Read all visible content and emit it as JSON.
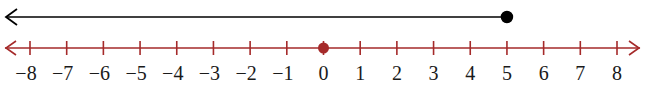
{
  "diagram": {
    "type": "number-line",
    "axis": {
      "min": -8,
      "max": 8,
      "step": 1,
      "tick_labels": [
        "−8",
        "−7",
        "−6",
        "−5",
        "−4",
        "−3",
        "−2",
        "−1",
        "0",
        "1",
        "2",
        "3",
        "4",
        "5",
        "6",
        "7",
        "8"
      ],
      "arrows": [
        "left",
        "right"
      ],
      "color": "#a52a2a",
      "marked_point": {
        "value": 0,
        "filled": true,
        "color": "#a52a2a"
      }
    },
    "graph": {
      "description": "Ray for x ≤ 5",
      "endpoint": 5,
      "endpoint_filled": true,
      "direction": "left",
      "color": "#000000"
    },
    "label_color": "#1a1a1a"
  }
}
